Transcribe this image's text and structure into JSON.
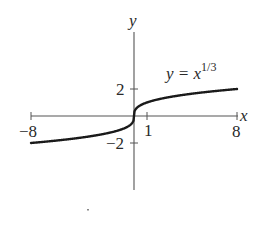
{
  "chart_data": {
    "type": "line",
    "title": "",
    "function_label": {
      "base": "y = x",
      "exponent": "1/3"
    },
    "xlabel": "x",
    "ylabel": "y",
    "xlim": [
      -8,
      8
    ],
    "ylim": [
      -6,
      6.3
    ],
    "grid": false,
    "legend": "none",
    "x_ticks": [
      {
        "value": -8,
        "label": "−8"
      },
      {
        "value": 1,
        "label": "1"
      },
      {
        "value": 8,
        "label": "8"
      }
    ],
    "y_ticks": [
      {
        "value": 2,
        "label": "2"
      },
      {
        "value": -2,
        "label": "−2"
      }
    ],
    "series": [
      {
        "name": "y = x^(1/3)",
        "x": [
          -8,
          -6,
          -4,
          -2,
          -1,
          -0.5,
          -0.1,
          0,
          0.1,
          0.5,
          1,
          2,
          4,
          6,
          8
        ],
        "y": [
          -2,
          -1.817,
          -1.587,
          -1.26,
          -1,
          -0.794,
          -0.464,
          0,
          0.464,
          0.794,
          1,
          1.26,
          1.587,
          1.817,
          2
        ]
      }
    ],
    "colors": {
      "curve": "#1a1a1a",
      "axes": "#555555",
      "text": "#2a2a2a"
    }
  }
}
